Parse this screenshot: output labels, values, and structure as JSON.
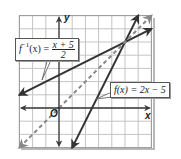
{
  "labels": {
    "y_axis": "y",
    "x_axis": "x",
    "origin": "O",
    "inverse_name": "f",
    "inverse_sup": "−1",
    "inverse_arg": "(x) =",
    "inverse_num": "x + 5",
    "inverse_den": "2",
    "f_label": "f(x) = 2x − 5"
  },
  "colors": {
    "grid": "#c4c4c4",
    "axis": "#3a3a3a",
    "line": "#333333",
    "dashed": "#888888",
    "shadow": "#b0b0b0"
  },
  "grid": {
    "xmin": -3,
    "xmax": 7,
    "ymin": -3,
    "ymax": 7,
    "origin_px": [
      59,
      108
    ],
    "unit_px": 13.2
  },
  "lines": [
    {
      "name": "f",
      "equation": "f(x) = 2x - 5",
      "from": [
        1,
        -3
      ],
      "to": [
        6,
        7
      ],
      "style": "solid"
    },
    {
      "name": "f_inverse",
      "equation": "f^-1(x) = (x + 5)/2",
      "from": [
        -3,
        1
      ],
      "to": [
        7,
        6
      ],
      "style": "solid"
    },
    {
      "name": "identity",
      "equation": "y = x",
      "from": [
        -3,
        -3
      ],
      "to": [
        7,
        7
      ],
      "style": "dashed"
    }
  ]
}
